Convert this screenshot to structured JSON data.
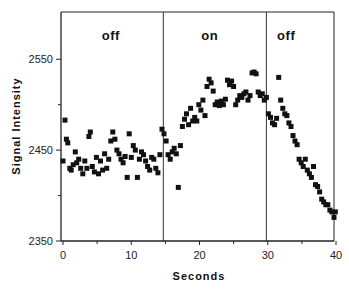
{
  "chart_data": {
    "type": "scatter",
    "title": "",
    "xlabel": "Seconds",
    "ylabel": "Signal Intensity",
    "xlim": [
      0,
      40
    ],
    "ylim": [
      2350,
      2602
    ],
    "xticks": [
      0,
      10,
      20,
      30,
      40
    ],
    "xtick_labels": [
      "0",
      "10",
      "20",
      "30",
      "40"
    ],
    "yticks": [
      2350,
      2450,
      2550
    ],
    "ytick_labels": [
      "2350",
      "2450",
      "2550"
    ],
    "yminor_ticks": [
      2400,
      2500
    ],
    "xminor_ticks": [
      5,
      15,
      25,
      35
    ],
    "grid": false,
    "dividers": [
      14.7,
      29.8
    ],
    "regions": [
      {
        "label": "off",
        "x_center": 7
      },
      {
        "label": "on",
        "x_center": 21.5
      },
      {
        "label": "off",
        "x_center": 32.7
      }
    ],
    "marker_color": "#111111",
    "series": [
      {
        "name": "signal",
        "points": [
          [
            0.0,
            2438
          ],
          [
            0.3,
            2483
          ],
          [
            0.5,
            2462
          ],
          [
            0.7,
            2458
          ],
          [
            1.0,
            2430
          ],
          [
            1.2,
            2428
          ],
          [
            1.5,
            2434
          ],
          [
            1.8,
            2448
          ],
          [
            2.0,
            2436
          ],
          [
            2.3,
            2440
          ],
          [
            2.6,
            2430
          ],
          [
            2.9,
            2424
          ],
          [
            3.2,
            2438
          ],
          [
            3.5,
            2430
          ],
          [
            3.8,
            2465
          ],
          [
            4.0,
            2470
          ],
          [
            4.3,
            2432
          ],
          [
            4.6,
            2426
          ],
          [
            4.9,
            2442
          ],
          [
            5.2,
            2424
          ],
          [
            5.5,
            2438
          ],
          [
            5.8,
            2428
          ],
          [
            6.1,
            2446
          ],
          [
            6.4,
            2430
          ],
          [
            6.7,
            2440
          ],
          [
            7.0,
            2460
          ],
          [
            7.3,
            2470
          ],
          [
            7.6,
            2462
          ],
          [
            7.9,
            2450
          ],
          [
            8.2,
            2446
          ],
          [
            8.5,
            2440
          ],
          [
            8.8,
            2436
          ],
          [
            9.1,
            2443
          ],
          [
            9.4,
            2420
          ],
          [
            9.7,
            2468
          ],
          [
            10.0,
            2442
          ],
          [
            10.3,
            2455
          ],
          [
            10.6,
            2450
          ],
          [
            10.9,
            2420
          ],
          [
            11.2,
            2440
          ],
          [
            11.5,
            2448
          ],
          [
            11.8,
            2445
          ],
          [
            12.1,
            2438
          ],
          [
            12.4,
            2432
          ],
          [
            12.7,
            2428
          ],
          [
            13.0,
            2442
          ],
          [
            13.3,
            2440
          ],
          [
            13.6,
            2430
          ],
          [
            13.9,
            2425
          ],
          [
            14.2,
            2445
          ],
          [
            14.5,
            2473
          ],
          [
            14.8,
            2468
          ],
          [
            15.1,
            2460
          ],
          [
            15.4,
            2445
          ],
          [
            15.7,
            2440
          ],
          [
            16.0,
            2448
          ],
          [
            16.3,
            2452
          ],
          [
            16.6,
            2446
          ],
          [
            16.9,
            2409
          ],
          [
            17.2,
            2455
          ],
          [
            17.5,
            2476
          ],
          [
            17.8,
            2484
          ],
          [
            18.1,
            2490
          ],
          [
            18.4,
            2478
          ],
          [
            18.7,
            2496
          ],
          [
            19.0,
            2482
          ],
          [
            19.3,
            2486
          ],
          [
            19.6,
            2482
          ],
          [
            19.9,
            2500
          ],
          [
            20.2,
            2494
          ],
          [
            20.5,
            2505
          ],
          [
            20.8,
            2488
          ],
          [
            21.1,
            2520
          ],
          [
            21.4,
            2528
          ],
          [
            21.7,
            2524
          ],
          [
            22.0,
            2515
          ],
          [
            22.3,
            2500
          ],
          [
            22.6,
            2503
          ],
          [
            22.9,
            2499
          ],
          [
            23.2,
            2504
          ],
          [
            23.5,
            2500
          ],
          [
            23.8,
            2506
          ],
          [
            24.1,
            2527
          ],
          [
            24.4,
            2522
          ],
          [
            24.7,
            2526
          ],
          [
            25.0,
            2520
          ],
          [
            25.3,
            2500
          ],
          [
            25.6,
            2505
          ],
          [
            25.9,
            2510
          ],
          [
            26.2,
            2508
          ],
          [
            26.5,
            2512
          ],
          [
            26.8,
            2514
          ],
          [
            27.1,
            2505
          ],
          [
            27.4,
            2510
          ],
          [
            27.7,
            2535
          ],
          [
            28.0,
            2536
          ],
          [
            28.3,
            2534
          ],
          [
            28.6,
            2514
          ],
          [
            28.9,
            2510
          ],
          [
            29.2,
            2512
          ],
          [
            29.5,
            2505
          ],
          [
            29.8,
            2508
          ],
          [
            30.1,
            2490
          ],
          [
            30.4,
            2486
          ],
          [
            30.7,
            2480
          ],
          [
            31.0,
            2478
          ],
          [
            31.3,
            2485
          ],
          [
            31.6,
            2530
          ],
          [
            31.9,
            2505
          ],
          [
            32.2,
            2496
          ],
          [
            32.5,
            2490
          ],
          [
            32.8,
            2488
          ],
          [
            33.1,
            2480
          ],
          [
            33.4,
            2476
          ],
          [
            33.7,
            2466
          ],
          [
            34.0,
            2460
          ],
          [
            34.3,
            2456
          ],
          [
            34.6,
            2440
          ],
          [
            34.9,
            2436
          ],
          [
            35.2,
            2432
          ],
          [
            35.5,
            2440
          ],
          [
            35.8,
            2428
          ],
          [
            36.1,
            2424
          ],
          [
            36.4,
            2420
          ],
          [
            36.7,
            2432
          ],
          [
            37.0,
            2412
          ],
          [
            37.3,
            2410
          ],
          [
            37.6,
            2404
          ],
          [
            37.9,
            2396
          ],
          [
            38.2,
            2393
          ],
          [
            38.5,
            2390
          ],
          [
            38.8,
            2390
          ],
          [
            39.1,
            2384
          ],
          [
            39.4,
            2382
          ],
          [
            39.7,
            2376
          ],
          [
            39.9,
            2382
          ]
        ]
      }
    ]
  }
}
